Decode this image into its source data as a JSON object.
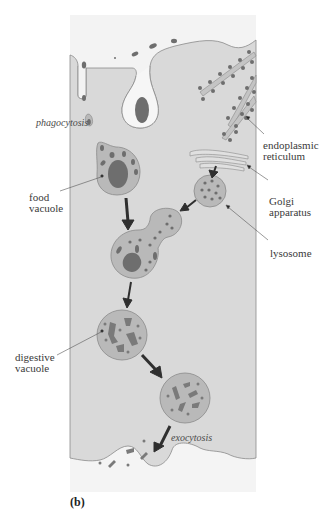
{
  "figure": {
    "panel_label": "(b)",
    "colors": {
      "cytoplasm": "#d9d9d9",
      "extracellular": "#f2f2f2",
      "membrane": "#8a8a8a",
      "vesicle_fill": "#b9b9b9",
      "particle": "#6e6e6e",
      "arrow": "#2f2f2f"
    }
  },
  "labels": {
    "phagocytosis": "phagocytosis",
    "er_line1": "endoplasmic",
    "er_line2": "reticulum",
    "golgi_line1": "Golgi",
    "golgi_line2": "apparatus",
    "lysosome": "lysosome",
    "food_line1": "food",
    "food_line2": "vacuole",
    "digestive_line1": "digestive",
    "digestive_line2": "vacuole",
    "exocytosis": "exocytosis"
  }
}
